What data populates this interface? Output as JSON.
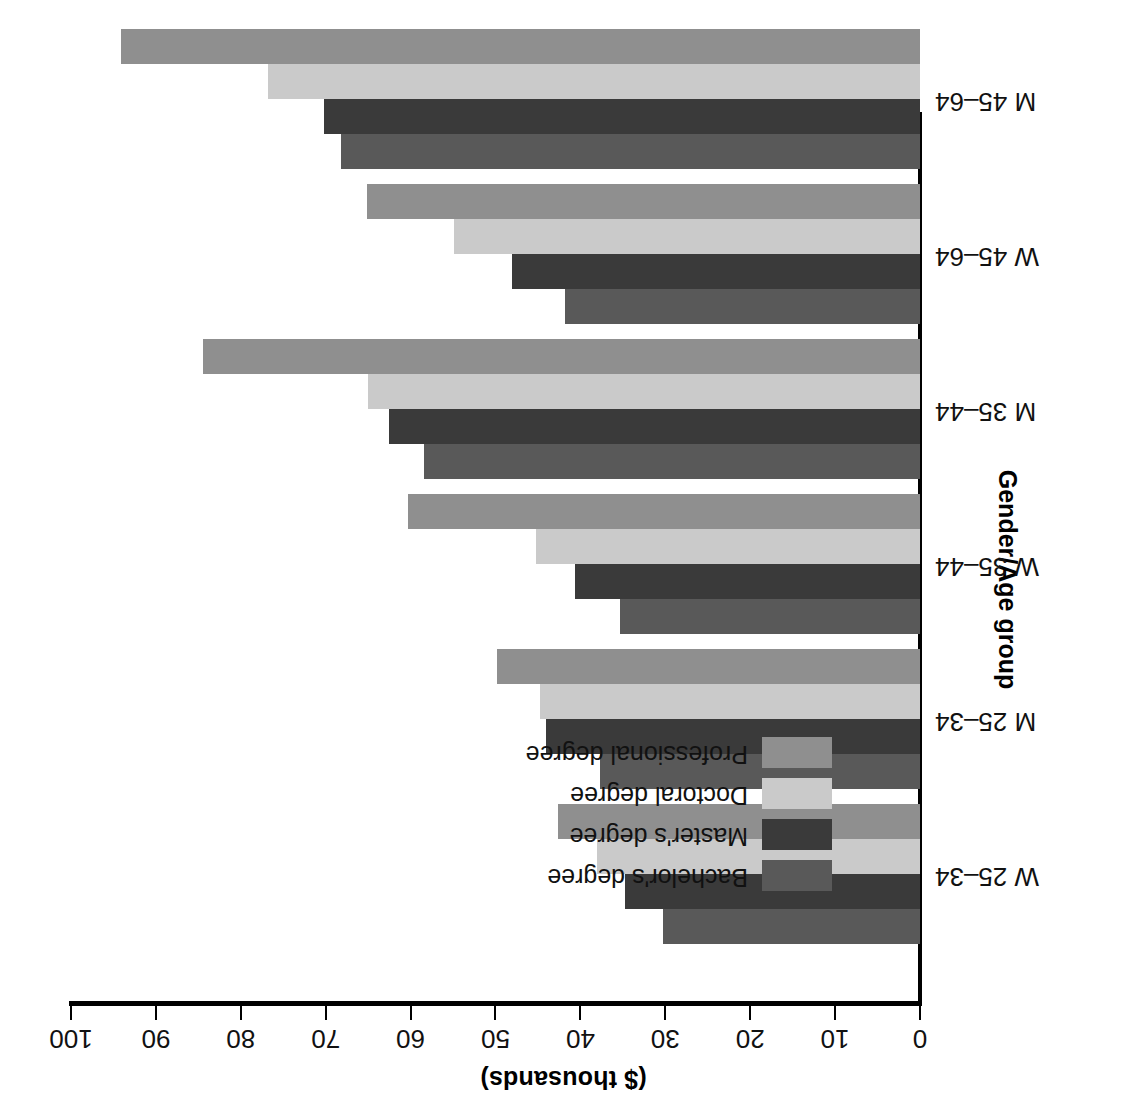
{
  "chart": {
    "type": "bar",
    "orientation": "horizontal-grouped",
    "value_axis_title": "($ thousands)",
    "category_axis_title": "Gender/Age group",
    "value_ticks": [
      0,
      10,
      20,
      30,
      40,
      50,
      60,
      70,
      80,
      90,
      100
    ],
    "value_range": [
      0,
      100
    ],
    "grid": false,
    "legend_position": "upper-left-inside"
  },
  "legend": {
    "items": [
      {
        "label": "Bachelor's degree",
        "color": "#595959"
      },
      {
        "label": "Master's degree",
        "color": "#3a3a3a"
      },
      {
        "label": "Doctoral degree",
        "color": "#cacaca"
      },
      {
        "label": "Professional degree",
        "color": "#8f8f8f"
      }
    ]
  },
  "chart_data": {
    "type": "bar",
    "title": "",
    "subtitle": "",
    "xlabel": "($ thousands)",
    "ylabel": "Gender/Age group",
    "xlim": [
      0,
      100
    ],
    "grid": false,
    "legend_position": "upper-left-inside",
    "categories": [
      "W 25–34",
      "M 25–34",
      "W 35–44",
      "M 35–44",
      "W 45–64",
      "M 45–64"
    ],
    "series": [
      {
        "name": "Bachelor's degree",
        "color": "#595959",
        "values": [
          30.3,
          37.7,
          35.3,
          58.4,
          41.8,
          68.2
        ]
      },
      {
        "name": "Master's degree",
        "color": "#3a3a3a",
        "values": [
          34.8,
          44.0,
          40.6,
          62.6,
          48.1,
          70.2
        ]
      },
      {
        "name": "Doctoral degree",
        "color": "#cacaca",
        "values": [
          38.1,
          44.8,
          45.2,
          65.0,
          54.9,
          76.8
        ]
      },
      {
        "name": "Professional degree",
        "color": "#8f8f8f",
        "values": [
          42.6,
          49.8,
          60.3,
          84.5,
          65.1,
          94.1
        ]
      }
    ]
  }
}
